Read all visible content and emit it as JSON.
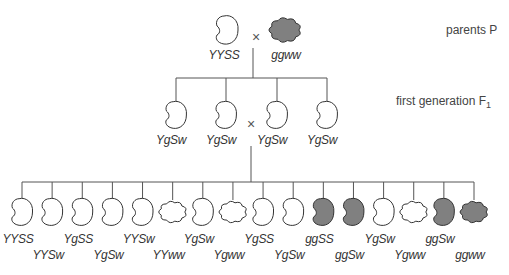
{
  "colors": {
    "line": "#555555",
    "seed_outline": "#333333",
    "yellow_fill": "#ffffff",
    "green_fill": "#808080"
  },
  "labels": {
    "parents": "parents P",
    "f1_prefix": "first generation F",
    "f1_sub": "1",
    "cross": "×"
  },
  "parents": [
    {
      "genotype": "YYSS",
      "color": "yellow",
      "shape": "smooth",
      "x": 227,
      "label_y": 62
    },
    {
      "genotype": "ggww",
      "color": "green",
      "shape": "wrinkled",
      "x": 285,
      "label_y": 62
    }
  ],
  "f1": [
    {
      "genotype": "YgSw",
      "color": "yellow",
      "shape": "smooth",
      "x": 176
    },
    {
      "genotype": "YgSw",
      "color": "yellow",
      "shape": "smooth",
      "x": 226
    },
    {
      "genotype": "YgSw",
      "color": "yellow",
      "shape": "smooth",
      "x": 277
    },
    {
      "genotype": "YgSw",
      "color": "yellow",
      "shape": "smooth",
      "x": 327
    }
  ],
  "f2": [
    {
      "genotype": "YYSS",
      "color": "yellow",
      "shape": "smooth",
      "label_row": 0
    },
    {
      "genotype": "YYSw",
      "color": "yellow",
      "shape": "smooth",
      "label_row": 1
    },
    {
      "genotype": "YgSS",
      "color": "yellow",
      "shape": "smooth",
      "label_row": 0
    },
    {
      "genotype": "YgSw",
      "color": "yellow",
      "shape": "smooth",
      "label_row": 1
    },
    {
      "genotype": "YYSw",
      "color": "yellow",
      "shape": "smooth",
      "label_row": 0
    },
    {
      "genotype": "YYww",
      "color": "yellow",
      "shape": "wrinkled",
      "label_row": 1
    },
    {
      "genotype": "YgSw",
      "color": "yellow",
      "shape": "smooth",
      "label_row": 0
    },
    {
      "genotype": "Ygww",
      "color": "yellow",
      "shape": "wrinkled",
      "label_row": 1
    },
    {
      "genotype": "YgSS",
      "color": "yellow",
      "shape": "smooth",
      "label_row": 0
    },
    {
      "genotype": "YgSw",
      "color": "yellow",
      "shape": "smooth",
      "label_row": 1
    },
    {
      "genotype": "ggSS",
      "color": "green",
      "shape": "smooth",
      "label_row": 0
    },
    {
      "genotype": "ggSw",
      "color": "green",
      "shape": "smooth",
      "label_row": 1
    },
    {
      "genotype": "YgSw",
      "color": "yellow",
      "shape": "smooth",
      "label_row": 0
    },
    {
      "genotype": "Ygww",
      "color": "yellow",
      "shape": "wrinkled",
      "label_row": 1
    },
    {
      "genotype": "ggSw",
      "color": "green",
      "shape": "smooth",
      "label_row": 0
    },
    {
      "genotype": "ggww",
      "color": "green",
      "shape": "wrinkled",
      "label_row": 1
    }
  ]
}
